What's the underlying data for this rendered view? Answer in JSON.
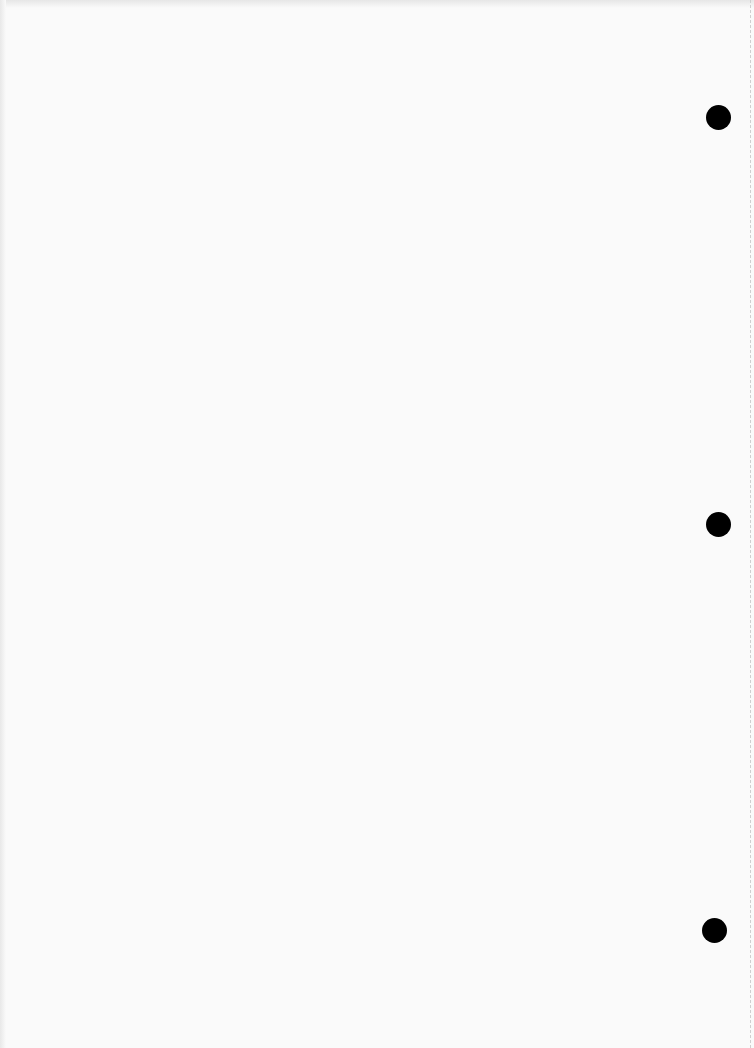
{
  "document": {
    "type": "blank scanned page",
    "punch_holes": [
      {
        "cx": 718,
        "cy": 117,
        "r": 12
      },
      {
        "cx": 718,
        "cy": 524,
        "r": 12
      },
      {
        "cx": 714,
        "cy": 930,
        "r": 12
      }
    ]
  }
}
